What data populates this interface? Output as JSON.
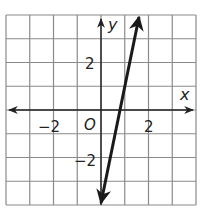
{
  "chart_data": {
    "type": "line",
    "title": "",
    "xlabel": "x",
    "ylabel": "y",
    "xlim": [
      -4,
      4
    ],
    "ylim": [
      -4,
      4
    ],
    "grid": true,
    "grid_step": 1,
    "origin_label": "O",
    "x_tick_labels": [
      {
        "value": -2,
        "label": "−2"
      },
      {
        "value": 2,
        "label": "2"
      }
    ],
    "y_tick_labels": [
      {
        "value": 2,
        "label": "2"
      },
      {
        "value": -2,
        "label": "−2"
      }
    ],
    "series": [
      {
        "name": "line",
        "equation": "y = 5x - 4",
        "slope": 5,
        "intercept": -4,
        "x": [
          0,
          1.6
        ],
        "y": [
          -4,
          4
        ],
        "arrows_both_ends": true
      }
    ],
    "legend": null
  },
  "colors": {
    "grid": "#8a8a8a",
    "axes": "#222222",
    "line": "#1a1a1a",
    "background": "#ffffff"
  }
}
